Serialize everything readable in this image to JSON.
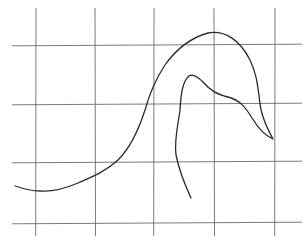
{
  "diagram": {
    "type": "hand-drawn curve on grid",
    "background_color": "#ffffff",
    "grid": {
      "color": "#6a6a6a",
      "vertical_x": [
        36,
        95,
        154,
        214,
        275
      ],
      "vertical_y_range": [
        8,
        236
      ],
      "horizontal_y": [
        45,
        104,
        162,
        223
      ],
      "horizontal_x_range": [
        12,
        302
      ]
    },
    "curve": {
      "color": "#2a2a2a",
      "path": "M15,186 C24,189 30,191 40,191 C52,192 64,189 78,183 C92,177 105,172 118,160 C130,148 138,132 145,110 C150,92 155,80 165,65 C177,48 190,38 208,33 C225,30 240,40 250,60 C258,76 258,92 261,110 C264,122 268,130 273,139 C266,136 258,128 252,118 C246,108 240,100 228,97 C216,94 210,90 203,82 C198,77 193,73 189,76 C182,82 181,95 180,110 C178,125 174,140 176,155 C179,170 185,185 191,198"
    }
  }
}
